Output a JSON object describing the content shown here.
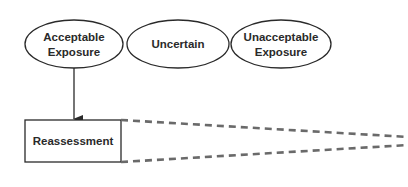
{
  "diagram": {
    "nodes": [
      {
        "id": "acceptable",
        "shape": "ellipse",
        "lines": [
          "Acceptable",
          "Exposure"
        ]
      },
      {
        "id": "uncertain",
        "shape": "ellipse",
        "lines": [
          "Uncertain"
        ]
      },
      {
        "id": "unacceptable",
        "shape": "ellipse",
        "lines": [
          "Unacceptable",
          "Exposure"
        ]
      },
      {
        "id": "reassessment",
        "shape": "rectangle",
        "lines": [
          "Reassessment"
        ]
      }
    ],
    "edges": [
      {
        "from": "acceptable",
        "to": "reassessment",
        "style": "solid-arrow"
      },
      {
        "from": "reassessment",
        "to": "offscreen-right",
        "style": "dashed-funnel"
      }
    ],
    "colors": {
      "stroke": "#2a2a2a",
      "dash": "#6a6a6a",
      "background": "#ffffff"
    }
  }
}
